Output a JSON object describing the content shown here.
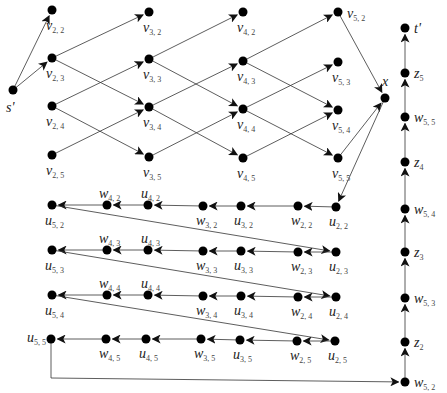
{
  "diagram": {
    "type": "directed-graph",
    "nodes": [
      {
        "id": "s'",
        "label": "s'",
        "sub": "",
        "x": 13,
        "y": 90,
        "lx": 6,
        "ly": 112
      },
      {
        "id": "v22",
        "label": "v",
        "sub": "2, 2",
        "x": 52,
        "y": 10,
        "lx": 46,
        "ly": 30
      },
      {
        "id": "v23",
        "label": "v",
        "sub": "2, 3",
        "x": 52,
        "y": 58,
        "lx": 46,
        "ly": 78
      },
      {
        "id": "v24",
        "label": "v",
        "sub": "2, 4",
        "x": 52,
        "y": 106,
        "lx": 46,
        "ly": 126
      },
      {
        "id": "v25",
        "label": "v",
        "sub": "2, 5",
        "x": 52,
        "y": 155,
        "lx": 46,
        "ly": 175
      },
      {
        "id": "v32",
        "label": "v",
        "sub": "3, 2",
        "x": 149,
        "y": 12,
        "lx": 143,
        "ly": 32
      },
      {
        "id": "v33",
        "label": "v",
        "sub": "3, 3",
        "x": 149,
        "y": 59,
        "lx": 143,
        "ly": 79
      },
      {
        "id": "v34",
        "label": "v",
        "sub": "3, 4",
        "x": 149,
        "y": 107,
        "lx": 143,
        "ly": 127
      },
      {
        "id": "v35",
        "label": "v",
        "sub": "3, 5",
        "x": 149,
        "y": 157,
        "lx": 143,
        "ly": 177
      },
      {
        "id": "v42",
        "label": "v",
        "sub": "4, 2",
        "x": 243,
        "y": 12,
        "lx": 237,
        "ly": 32
      },
      {
        "id": "v43",
        "label": "v",
        "sub": "4, 3",
        "x": 243,
        "y": 61,
        "lx": 237,
        "ly": 81
      },
      {
        "id": "v44",
        "label": "v",
        "sub": "4, 4",
        "x": 243,
        "y": 109,
        "lx": 237,
        "ly": 129
      },
      {
        "id": "v45",
        "label": "v",
        "sub": "4, 5",
        "x": 243,
        "y": 158,
        "lx": 237,
        "ly": 178
      },
      {
        "id": "v52",
        "label": "v",
        "sub": "5, 2",
        "x": 338,
        "y": 12,
        "lx": 347,
        "ly": 18
      },
      {
        "id": "v53",
        "label": "v",
        "sub": "5, 3",
        "x": 338,
        "y": 62,
        "lx": 332,
        "ly": 82
      },
      {
        "id": "v54",
        "label": "v",
        "sub": "5, 4",
        "x": 338,
        "y": 110,
        "lx": 332,
        "ly": 130
      },
      {
        "id": "v55",
        "label": "v",
        "sub": "5, 5",
        "x": 338,
        "y": 158,
        "lx": 332,
        "ly": 178
      },
      {
        "id": "x",
        "label": "x",
        "sub": "",
        "x": 385,
        "y": 98,
        "lx": 382,
        "ly": 86
      },
      {
        "id": "u52",
        "label": "u",
        "sub": "5, 2",
        "x": 52,
        "y": 205,
        "lx": 45,
        "ly": 225
      },
      {
        "id": "w42",
        "label": "w",
        "sub": "4, 2",
        "x": 107,
        "y": 205,
        "lx": 99,
        "ly": 198
      },
      {
        "id": "u42",
        "label": "u",
        "sub": "4, 2",
        "x": 148,
        "y": 205,
        "lx": 141,
        "ly": 198
      },
      {
        "id": "w32",
        "label": "w",
        "sub": "3, 2",
        "x": 203,
        "y": 206,
        "lx": 196,
        "ly": 225
      },
      {
        "id": "u32",
        "label": "u",
        "sub": "3, 2",
        "x": 241,
        "y": 206,
        "lx": 234,
        "ly": 225
      },
      {
        "id": "w22",
        "label": "w",
        "sub": "2, 2",
        "x": 298,
        "y": 206,
        "lx": 291,
        "ly": 225
      },
      {
        "id": "u22",
        "label": "u",
        "sub": "2, 2",
        "x": 336,
        "y": 207,
        "lx": 329,
        "ly": 226
      },
      {
        "id": "u53",
        "label": "u",
        "sub": "5, 3",
        "x": 52,
        "y": 250,
        "lx": 45,
        "ly": 270
      },
      {
        "id": "w43",
        "label": "w",
        "sub": "4, 3",
        "x": 107,
        "y": 250,
        "lx": 99,
        "ly": 243
      },
      {
        "id": "u43",
        "label": "u",
        "sub": "4, 3",
        "x": 148,
        "y": 250,
        "lx": 141,
        "ly": 243
      },
      {
        "id": "w33",
        "label": "w",
        "sub": "3, 3",
        "x": 203,
        "y": 251,
        "lx": 196,
        "ly": 270
      },
      {
        "id": "u33",
        "label": "u",
        "sub": "3, 3",
        "x": 241,
        "y": 251,
        "lx": 234,
        "ly": 270
      },
      {
        "id": "w23",
        "label": "w",
        "sub": "2, 3",
        "x": 298,
        "y": 252,
        "lx": 291,
        "ly": 271
      },
      {
        "id": "u23",
        "label": "u",
        "sub": "2, 3",
        "x": 336,
        "y": 252,
        "lx": 329,
        "ly": 271
      },
      {
        "id": "u54",
        "label": "u",
        "sub": "5, 4",
        "x": 52,
        "y": 295,
        "lx": 45,
        "ly": 315
      },
      {
        "id": "w44",
        "label": "w",
        "sub": "4, 4",
        "x": 107,
        "y": 295,
        "lx": 99,
        "ly": 288
      },
      {
        "id": "u44",
        "label": "u",
        "sub": "4, 4",
        "x": 148,
        "y": 295,
        "lx": 141,
        "ly": 288
      },
      {
        "id": "w34",
        "label": "w",
        "sub": "3, 4",
        "x": 203,
        "y": 296,
        "lx": 196,
        "ly": 315
      },
      {
        "id": "u34",
        "label": "u",
        "sub": "3, 4",
        "x": 241,
        "y": 296,
        "lx": 234,
        "ly": 315
      },
      {
        "id": "w24",
        "label": "w",
        "sub": "2, 4",
        "x": 298,
        "y": 297,
        "lx": 291,
        "ly": 316
      },
      {
        "id": "u24",
        "label": "u",
        "sub": "2, 4",
        "x": 336,
        "y": 297,
        "lx": 329,
        "ly": 316
      },
      {
        "id": "u55",
        "label": "u",
        "sub": "5, 5",
        "x": 51,
        "y": 339,
        "lx": 27,
        "ly": 342
      },
      {
        "id": "w45",
        "label": "w",
        "sub": "4, 5",
        "x": 106,
        "y": 339,
        "lx": 99,
        "ly": 358
      },
      {
        "id": "u45",
        "label": "u",
        "sub": "4, 5",
        "x": 146,
        "y": 339,
        "lx": 139,
        "ly": 358
      },
      {
        "id": "w35",
        "label": "w",
        "sub": "3, 5",
        "x": 201,
        "y": 339,
        "lx": 194,
        "ly": 358
      },
      {
        "id": "u35",
        "label": "u",
        "sub": "3, 5",
        "x": 240,
        "y": 340,
        "lx": 233,
        "ly": 359
      },
      {
        "id": "w25",
        "label": "w",
        "sub": "2, 5",
        "x": 297,
        "y": 341,
        "lx": 290,
        "ly": 360
      },
      {
        "id": "u25",
        "label": "u",
        "sub": "2, 5",
        "x": 335,
        "y": 341,
        "lx": 328,
        "ly": 360
      },
      {
        "id": "tp",
        "label": "t'",
        "sub": "",
        "x": 405,
        "y": 28,
        "lx": 414,
        "ly": 33
      },
      {
        "id": "z5",
        "label": "z",
        "sub": "5",
        "x": 405,
        "y": 73,
        "lx": 414,
        "ly": 78
      },
      {
        "id": "w55",
        "label": "w",
        "sub": "5, 5",
        "x": 405,
        "y": 117,
        "lx": 414,
        "ly": 122
      },
      {
        "id": "z4",
        "label": "z",
        "sub": "4",
        "x": 405,
        "y": 162,
        "lx": 414,
        "ly": 167
      },
      {
        "id": "w54",
        "label": "w",
        "sub": "5, 4",
        "x": 405,
        "y": 209,
        "lx": 414,
        "ly": 214
      },
      {
        "id": "z3",
        "label": "z",
        "sub": "3",
        "x": 405,
        "y": 252,
        "lx": 414,
        "ly": 257
      },
      {
        "id": "w53",
        "label": "w",
        "sub": "5, 3",
        "x": 405,
        "y": 298,
        "lx": 414,
        "ly": 303
      },
      {
        "id": "z2",
        "label": "z",
        "sub": "2",
        "x": 405,
        "y": 342,
        "lx": 414,
        "ly": 347
      },
      {
        "id": "w52",
        "label": "w",
        "sub": "5, 2",
        "x": 405,
        "y": 382,
        "lx": 414,
        "ly": 387
      }
    ],
    "edges": [
      [
        "s'",
        "v22"
      ],
      [
        "s'",
        "v23"
      ],
      [
        "v23",
        "v32"
      ],
      [
        "v23",
        "v34"
      ],
      [
        "v24",
        "v33"
      ],
      [
        "v24",
        "v35"
      ],
      [
        "v25",
        "v34"
      ],
      [
        "v33",
        "v42"
      ],
      [
        "v33",
        "v44"
      ],
      [
        "v34",
        "v43"
      ],
      [
        "v34",
        "v45"
      ],
      [
        "v35",
        "v44"
      ],
      [
        "v43",
        "v52"
      ],
      [
        "v43",
        "v54"
      ],
      [
        "v44",
        "v53"
      ],
      [
        "v44",
        "v55"
      ],
      [
        "v45",
        "v54"
      ],
      [
        "v52",
        "x"
      ],
      [
        "v55",
        "x"
      ],
      [
        "x",
        "u22"
      ],
      [
        "u22",
        "w22"
      ],
      [
        "w22",
        "u32"
      ],
      [
        "u32",
        "w32"
      ],
      [
        "w32",
        "u42"
      ],
      [
        "u42",
        "w42"
      ],
      [
        "w42",
        "u52"
      ],
      [
        "u52",
        "u23"
      ],
      [
        "u23",
        "w23"
      ],
      [
        "w23",
        "u33"
      ],
      [
        "u33",
        "w33"
      ],
      [
        "w33",
        "u43"
      ],
      [
        "u43",
        "w43"
      ],
      [
        "w43",
        "u53"
      ],
      [
        "u53",
        "u24"
      ],
      [
        "u24",
        "w24"
      ],
      [
        "w24",
        "u34"
      ],
      [
        "u34",
        "w34"
      ],
      [
        "w34",
        "u44"
      ],
      [
        "u44",
        "w44"
      ],
      [
        "w44",
        "u54"
      ],
      [
        "u54",
        "u25"
      ],
      [
        "u25",
        "w25"
      ],
      [
        "w25",
        "u35"
      ],
      [
        "u35",
        "w35"
      ],
      [
        "w35",
        "u45"
      ],
      [
        "u45",
        "w45"
      ],
      [
        "w45",
        "u55"
      ],
      [
        "w52",
        "z2"
      ],
      [
        "z2",
        "w53"
      ],
      [
        "w53",
        "z3"
      ],
      [
        "z3",
        "w54"
      ],
      [
        "w54",
        "z4"
      ],
      [
        "z4",
        "w55"
      ],
      [
        "w55",
        "z5"
      ],
      [
        "z5",
        "tp"
      ]
    ],
    "polyline_edges": [
      {
        "from": "u55",
        "to": "w52",
        "points": [
          [
            51,
            339
          ],
          [
            51,
            378
          ],
          [
            405,
            382
          ]
        ]
      }
    ]
  }
}
